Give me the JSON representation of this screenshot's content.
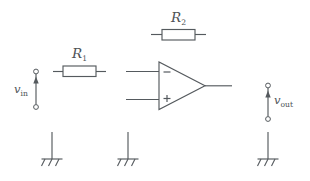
{
  "diagram": {
    "background_color": "#ffffff",
    "line_color": "#555a5e",
    "labels": {
      "r1": "R",
      "r1_sub": "1",
      "r2": "R",
      "r2_sub": "2",
      "vin": "v",
      "vin_sub": "in",
      "vout": "v",
      "vout_sub": "out"
    },
    "components": [
      {
        "name": "source-vin",
        "type": "voltage-source-terminals",
        "label": "v_in",
        "arrow_direction": "up"
      },
      {
        "name": "resistor-r1",
        "type": "resistor",
        "label": "R_1",
        "orientation": "horizontal"
      },
      {
        "name": "resistor-r2",
        "type": "resistor",
        "label": "R_2",
        "orientation": "horizontal"
      },
      {
        "name": "opamp",
        "type": "operational-amplifier",
        "inverting_input_sign": "−",
        "noninverting_input_sign": "+"
      },
      {
        "name": "source-vout",
        "type": "voltage-source-terminals",
        "label": "v_out",
        "arrow_direction": "up"
      },
      {
        "name": "ground-left",
        "type": "chassis-ground"
      },
      {
        "name": "ground-middle",
        "type": "chassis-ground"
      },
      {
        "name": "ground-right",
        "type": "chassis-ground"
      }
    ]
  }
}
